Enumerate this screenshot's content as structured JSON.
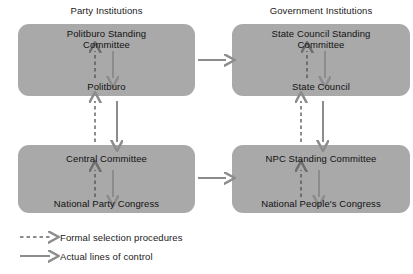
{
  "diagram": {
    "columns": [
      {
        "id": "party",
        "title": "Party Institutions"
      },
      {
        "id": "government",
        "title": "Government Institutions"
      }
    ],
    "boxes": [
      {
        "id": "party-top",
        "column": "party",
        "tier": "top",
        "upper_node": "Politburo Standing\nCommittee",
        "upper_node_line1": "Politburo Standing",
        "upper_node_line2": "Committee",
        "lower_node": "Politburo"
      },
      {
        "id": "gov-top",
        "column": "government",
        "tier": "top",
        "upper_node": "State Council Standing\nCommittee",
        "upper_node_line1": "State Council Standing",
        "upper_node_line2": "Committee",
        "lower_node": "State Council"
      },
      {
        "id": "party-bottom",
        "column": "party",
        "tier": "bottom",
        "upper_node_line1": "Central Committee",
        "upper_node_line2": "",
        "lower_node": "National Party Congress"
      },
      {
        "id": "gov-bottom",
        "column": "government",
        "tier": "bottom",
        "upper_node_line1": "NPC Standing Committee",
        "upper_node_line2": "",
        "lower_node": "National People's Congress"
      }
    ],
    "legend": {
      "items": [
        {
          "id": "formal",
          "style": "dashed",
          "label": "Formal selection procedures"
        },
        {
          "id": "actual",
          "style": "solid",
          "label": "Actual lines of control"
        }
      ]
    },
    "colors": {
      "box_fill": "#a9a9a9",
      "arrow_gray": "#8c8c8c",
      "arrow_dark": "#6e6e6e",
      "text": "#111111",
      "background": "#ffffff"
    }
  }
}
